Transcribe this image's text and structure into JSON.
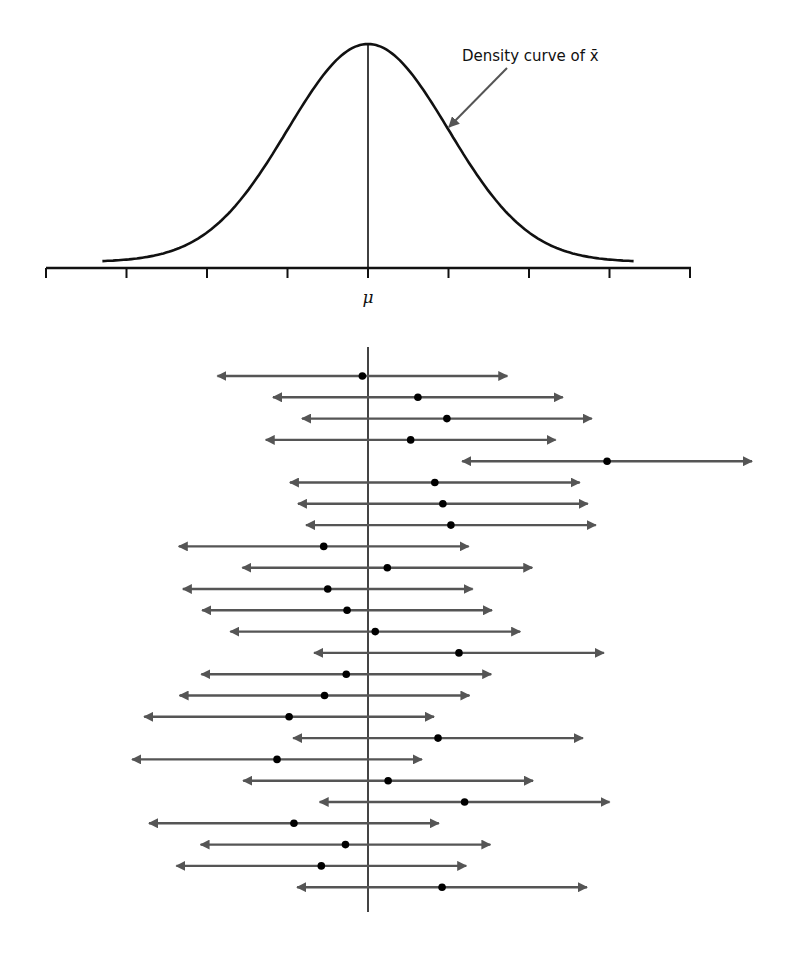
{
  "chart_data": {
    "type": "diagram",
    "title": "",
    "density_plot": {
      "type": "line",
      "description": "Normal density curve centered at mu",
      "annotation": "Density curve of x̄",
      "x_label": "μ",
      "tick_count": 9,
      "tick_positions_sd": [
        -4,
        -3,
        -2,
        -1,
        0,
        1,
        2,
        3,
        4
      ],
      "center_label": "μ",
      "curve_range_sd": [
        -3.3,
        3.3
      ]
    },
    "intervals": {
      "type": "interval_plot",
      "description": "25 confidence intervals, each centered on a sample mean (dot), with a vertical reference line at μ",
      "reference_line": "μ",
      "half_width_sd": 1.8,
      "centers_sd": [
        -0.07,
        0.62,
        0.98,
        0.53,
        2.97,
        0.83,
        0.93,
        1.03,
        -0.55,
        0.24,
        -0.5,
        -0.26,
        0.09,
        1.13,
        -0.27,
        -0.54,
        -0.98,
        0.87,
        -1.13,
        0.25,
        1.2,
        -0.92,
        -0.28,
        -0.58,
        0.92
      ],
      "captures_mu": [
        true,
        true,
        true,
        true,
        false,
        true,
        true,
        true,
        true,
        true,
        true,
        true,
        true,
        true,
        true,
        true,
        true,
        true,
        true,
        true,
        true,
        true,
        true,
        true,
        true
      ]
    }
  },
  "annotation": {
    "label": "Density curve of x̄"
  },
  "axis": {
    "center_label": "μ"
  },
  "colors": {
    "curve": "#111111",
    "axis": "#111111",
    "interval_line": "#555555",
    "point": "#000000"
  }
}
